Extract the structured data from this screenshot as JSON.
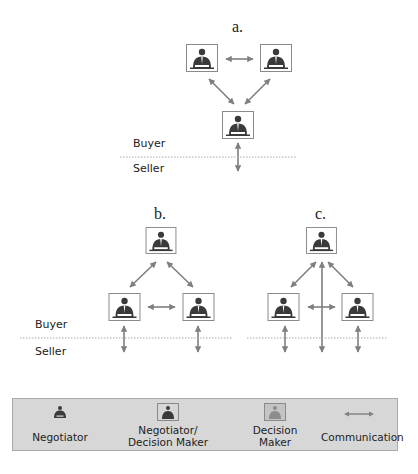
{
  "diagrams": [
    {
      "id": "a",
      "title": "a.",
      "buyer_label": "Buyer",
      "seller_label": "Seller"
    },
    {
      "id": "b",
      "title": "b.",
      "buyer_label": "Buyer",
      "seller_label": "Seller"
    },
    {
      "id": "c",
      "title": "c."
    }
  ],
  "legend": {
    "items": [
      {
        "label": "Negotiator",
        "icon": "negotiator-icon"
      },
      {
        "label_line1": "Negotiator/",
        "label_line2": "Decision Maker",
        "icon": "negotiator-decision-maker-icon"
      },
      {
        "label_line1": "Decision",
        "label_line2": "Maker",
        "icon": "decision-maker-icon"
      },
      {
        "label": "Communication",
        "icon": "communication-arrow-icon"
      }
    ]
  },
  "colors": {
    "arrow": "#7f7f7f",
    "figure": "#3a3a3a",
    "frame": "#8a8a8a",
    "legend_bg": "#d7d7d7",
    "dotted_line": "#a8a8a8"
  }
}
